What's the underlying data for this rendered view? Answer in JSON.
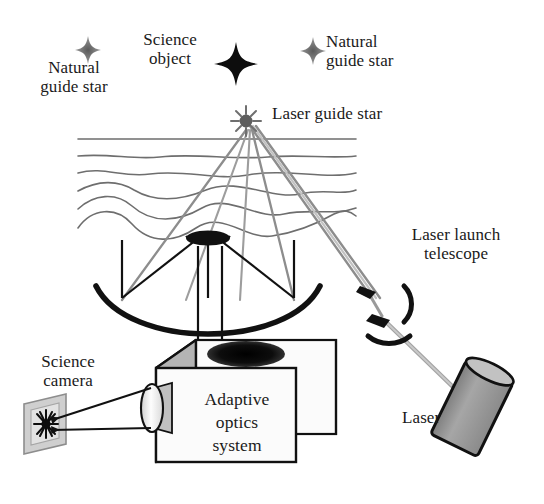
{
  "figure": {
    "background_color": "#ffffff",
    "width": 544,
    "height": 504
  },
  "labels": {
    "natural_guide_star_left": "Natural\nguide star",
    "science_object": "Science\nobject",
    "natural_guide_star_right": "Natural\nguide star",
    "laser_guide_star": "Laser guide star",
    "laser_launch_telescope": "Laser launch\ntelescope",
    "laser": "Laser",
    "science_camera": "Science\ncamera",
    "adaptive_optics_system": "Adaptive\noptics\nsystem"
  },
  "colors": {
    "ink": "#1a1a1a",
    "stroke": "#111111",
    "beam_gray": "#8a8a8a",
    "beam_gray_light": "#a8a8a8",
    "wavefront_gray": "#6e6e6e",
    "box_front": "#fbfbfb",
    "box_top": "#d8d8d8",
    "box_side": "#b4b4b4",
    "laser_body": "#9a9a9a",
    "mirror_dark": "#111111",
    "plate_gray": "#c8c8c8",
    "lens_fill": "#f2f2f2",
    "star_gray": "#7a7a7a"
  },
  "elements": {
    "stars": [
      {
        "name": "natural-guide-star-left",
        "x": 88,
        "y": 50,
        "size": 11,
        "tone": "gray"
      },
      {
        "name": "science-object",
        "x": 236,
        "y": 64,
        "size": 18,
        "tone": "black"
      },
      {
        "name": "natural-guide-star-right",
        "x": 313,
        "y": 51,
        "size": 11,
        "tone": "gray"
      },
      {
        "name": "laser-guide-star",
        "x": 246,
        "y": 121,
        "size": 9,
        "tone": "gray"
      }
    ],
    "wavefront_lines": {
      "count": 6,
      "x_start": 78,
      "x_end": 356,
      "y_first": 139,
      "y_spacing": 16,
      "description": "Progressively distorted atmospheric turbulence layers; top line straight, lower lines increasingly wavy"
    },
    "telescope": {
      "primary_mirror": "concave dish, center x 208, rim y 300, width 224",
      "secondary_mirror": "small convex mirror at x 208, y 237",
      "incoming_rays": [
        122,
        208,
        294
      ],
      "output_arrows_to_box": [
        198,
        222
      ]
    },
    "ao_box": {
      "front_face": "x 156-296, y 368-462",
      "top_face": "parallelogram skewed up-right",
      "left_face": "shaded side panel",
      "entrance_aperture": "dark ellipse on top face",
      "lens": "ellipse on left face"
    },
    "science_camera_plate": {
      "x": 22,
      "y": 400,
      "width": 44,
      "height": 52,
      "image": "black star burst at center"
    },
    "laser_unit": {
      "x": 455,
      "y": 390,
      "angle_deg": 25,
      "shape": "tilted cylinder"
    },
    "laser_launch_telescope_mirrors": [
      {
        "name": "upper-fold-mirror",
        "x": 366,
        "y": 288
      },
      {
        "name": "lower-fold-mirror",
        "x": 380,
        "y": 318
      }
    ],
    "beams": {
      "uplink": "narrow beam from launch telescope up-left to laser guide star",
      "downlink": "diverging return beam from laser guide star down-left to primary mirror",
      "laser_feed": "thin beam from laser unit up-left into launch telescope"
    }
  }
}
